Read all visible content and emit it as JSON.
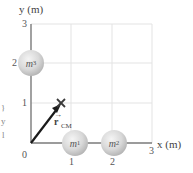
{
  "diagram": {
    "type": "center-of-mass-diagram",
    "axes": {
      "x_label": "x (m)",
      "y_label": "y (m)",
      "origin_label": "0",
      "x_ticks": [
        "1",
        "2",
        "3"
      ],
      "y_ticks": [
        "1",
        "2",
        "3"
      ],
      "axis_color": "#7a7a7a",
      "grid_color": "#e3e3e3"
    },
    "masses": [
      {
        "name": "m",
        "sub": "1",
        "x": 1,
        "y": 0
      },
      {
        "name": "m",
        "sub": "2",
        "x": 2,
        "y": 0
      },
      {
        "name": "m",
        "sub": "3",
        "x": 0,
        "y": 2
      }
    ],
    "center_of_mass": {
      "marker": "×",
      "x": 0.75,
      "y": 1.0,
      "vector_label": "r",
      "vector_label_sub": "CM",
      "vector_color": "#1a1a1a"
    },
    "edge_fragments": [
      "}",
      "y",
      "l"
    ]
  }
}
